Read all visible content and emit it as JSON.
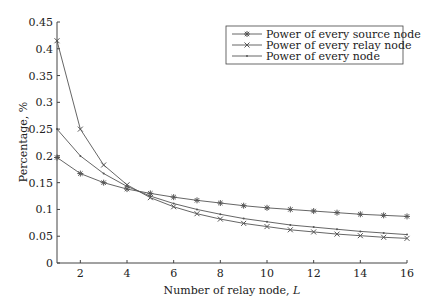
{
  "chart_data": {
    "type": "line",
    "title": "",
    "xlabel": "Number of relay node, L",
    "ylabel": "Percentage, %",
    "xlim": [
      1,
      16
    ],
    "ylim": [
      0,
      0.45
    ],
    "grid": false,
    "legend_position": "upper right",
    "x": [
      1,
      2,
      3,
      4,
      5,
      6,
      7,
      8,
      9,
      10,
      11,
      12,
      13,
      14,
      15,
      16
    ],
    "x_ticks": [
      "2",
      "4",
      "6",
      "8",
      "10",
      "12",
      "14",
      "16"
    ],
    "y_ticks": [
      "0",
      "0.05",
      "0.1",
      "0.15",
      "0.2",
      "0.25",
      "0.3",
      "0.35",
      "0.4",
      "0.45"
    ],
    "series": [
      {
        "name": "Power of every source node",
        "marker": "asterisk",
        "values": [
          0.197,
          0.167,
          0.15,
          0.138,
          0.13,
          0.123,
          0.117,
          0.112,
          0.107,
          0.103,
          0.1,
          0.097,
          0.094,
          0.091,
          0.089,
          0.087
        ]
      },
      {
        "name": "Power of every relay node",
        "marker": "x",
        "values": [
          0.415,
          0.25,
          0.183,
          0.146,
          0.122,
          0.105,
          0.092,
          0.082,
          0.074,
          0.068,
          0.062,
          0.058,
          0.054,
          0.051,
          0.048,
          0.046
        ]
      },
      {
        "name": "Power of every node",
        "marker": "dot",
        "values": [
          0.25,
          0.2,
          0.167,
          0.143,
          0.125,
          0.111,
          0.1,
          0.091,
          0.083,
          0.077,
          0.071,
          0.067,
          0.063,
          0.059,
          0.056,
          0.053
        ]
      }
    ]
  },
  "axes": {
    "xlabel_main": "Number of relay node, ",
    "xlabel_var": "L",
    "ylabel": "Percentage, %"
  },
  "colors": {
    "line": "#555555",
    "axis": "#444444",
    "text": "#222222"
  }
}
